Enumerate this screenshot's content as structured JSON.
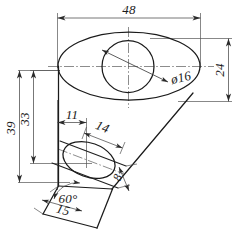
{
  "drawing": {
    "title": "Oblique projection of conical boss on inclined base",
    "units": "mm",
    "line_color": "#1a1a1a",
    "dim_color": "#4a4a4a",
    "background": "#ffffff"
  },
  "dimensions": {
    "top_width": "48",
    "right_height": "24",
    "hole_diameter": "ø16",
    "left_overall": "39",
    "left_inner": "33",
    "offset_11": "11",
    "base_14": "14",
    "thickness_8": "8",
    "base_15": "15",
    "angle_60": "60°"
  },
  "features": {
    "top_ellipse": "large-ellipse",
    "top_hole": "circle-hole",
    "bottom_ellipse": "small-inclined-ellipse",
    "base": "inclined-parallelogram-base",
    "center_lines": "centre-axis-marks"
  }
}
